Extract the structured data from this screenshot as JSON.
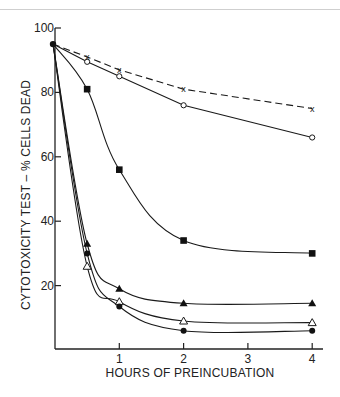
{
  "chart_data": {
    "type": "line",
    "title": "",
    "xlabel": "HOURS OF PREINCUBATION",
    "ylabel": "CYTOTOXICITY TEST – % CELLS DEAD",
    "xlim": [
      0,
      4.2
    ],
    "ylim": [
      0,
      100
    ],
    "x_ticks": [
      1,
      2,
      3,
      4
    ],
    "x_tick_labels": [
      "1",
      "2",
      "3",
      "4"
    ],
    "y_ticks": [
      20,
      40,
      60,
      80,
      100
    ],
    "y_tick_labels": [
      "20",
      "40",
      "60",
      "80",
      "100"
    ],
    "grid": false,
    "legend": null,
    "series": [
      {
        "name": "x (dashed)",
        "marker": "x",
        "line": "dashed",
        "x": [
          0,
          0.5,
          1,
          2,
          4
        ],
        "values": [
          95,
          91,
          87,
          81,
          75
        ]
      },
      {
        "name": "open circle",
        "marker": "open-circle",
        "line": "solid",
        "x": [
          0,
          0.5,
          1,
          2,
          4
        ],
        "values": [
          95,
          89.5,
          85,
          76,
          66
        ]
      },
      {
        "name": "filled square",
        "marker": "filled-square",
        "line": "solid",
        "x": [
          0,
          0.5,
          1,
          2,
          4
        ],
        "values": [
          95,
          81,
          56,
          34,
          30
        ]
      },
      {
        "name": "filled triangle",
        "marker": "filled-triangle",
        "line": "solid",
        "x": [
          0,
          0.5,
          1,
          2,
          4
        ],
        "values": [
          95,
          33,
          19,
          14.5,
          14.5
        ]
      },
      {
        "name": "open triangle",
        "marker": "open-triangle",
        "line": "solid",
        "x": [
          0,
          0.5,
          1,
          2,
          4
        ],
        "values": [
          95,
          26,
          15,
          9,
          8.5
        ]
      },
      {
        "name": "filled circle",
        "marker": "filled-circle",
        "line": "solid",
        "x": [
          0,
          0.5,
          1,
          2,
          4
        ],
        "values": [
          95,
          30,
          13.5,
          6,
          6
        ]
      }
    ]
  }
}
